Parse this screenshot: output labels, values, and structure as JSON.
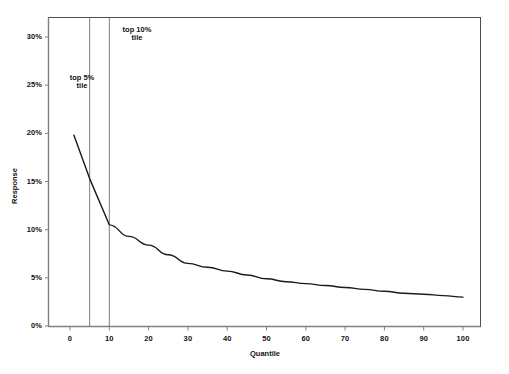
{
  "chart_data": {
    "type": "line",
    "title": "",
    "xlabel": "Quantile",
    "ylabel": "Response",
    "xlim": [
      -3,
      106
    ],
    "ylim": [
      0,
      31
    ],
    "grid": false,
    "legend": null,
    "x_ticks": [
      0,
      10,
      20,
      30,
      40,
      50,
      60,
      70,
      80,
      90,
      100
    ],
    "x_tick_labels": [
      "0",
      "10",
      "20",
      "30",
      "40",
      "50",
      "60",
      "70",
      "80",
      "90",
      "100"
    ],
    "y_ticks": [
      0,
      5,
      10,
      15,
      20,
      25,
      30
    ],
    "y_tick_labels": [
      "0%",
      "5%",
      "10%",
      "15%",
      "20%",
      "25%",
      "30%"
    ],
    "series": [
      {
        "name": "Response",
        "x": [
          1,
          5,
          10,
          15,
          20,
          25,
          30,
          35,
          40,
          45,
          50,
          55,
          60,
          65,
          70,
          75,
          80,
          85,
          90,
          95,
          100
        ],
        "values": [
          19.8,
          15.3,
          10.5,
          9.3,
          8.4,
          7.4,
          6.5,
          6.1,
          5.7,
          5.3,
          4.9,
          4.6,
          4.4,
          4.2,
          4.0,
          3.8,
          3.6,
          3.4,
          3.3,
          3.15,
          3.0
        ]
      }
    ],
    "reference_lines": [
      {
        "x": 5,
        "label": "top 5%\ntile"
      },
      {
        "x": 10,
        "label": "top 10%\ntile"
      }
    ],
    "annotations": [
      {
        "text": "top 5%\ntile",
        "x": 5,
        "y": 26.5
      },
      {
        "text": "top 10%\ntile",
        "x": 12,
        "y": 31.5
      }
    ],
    "colors": {
      "line": "#1a1a1a",
      "axis": "#808080",
      "reference_line": "#808080",
      "border": "#4d4d4d",
      "background": "#ffffff",
      "text": "#111111"
    }
  }
}
